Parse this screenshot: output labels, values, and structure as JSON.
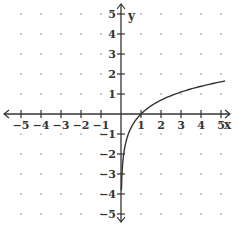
{
  "chart_data": {
    "type": "line",
    "title": "",
    "function": "y = ln(x)",
    "xlabel": "x",
    "ylabel": "y",
    "xlim": [
      -5,
      5
    ],
    "ylim": [
      -5,
      5
    ],
    "xticks": [
      -5,
      -4,
      -3,
      -2,
      -1,
      1,
      2,
      3,
      4,
      5
    ],
    "yticks": [
      -5,
      -4,
      -3,
      -2,
      -1,
      1,
      2,
      3,
      4,
      5
    ],
    "grid": "dots",
    "series": [
      {
        "name": "ln(x)",
        "x": [
          0.022,
          0.05,
          0.1,
          0.2,
          0.3,
          0.5,
          0.75,
          1,
          1.5,
          2,
          2.5,
          3,
          3.5,
          4,
          4.5,
          5.2
        ],
        "values": [
          -3.82,
          -3.0,
          -2.3,
          -1.61,
          -1.2,
          -0.69,
          -0.29,
          0,
          0.41,
          0.69,
          0.92,
          1.1,
          1.25,
          1.39,
          1.5,
          1.65
        ]
      }
    ],
    "color": "#333333"
  }
}
